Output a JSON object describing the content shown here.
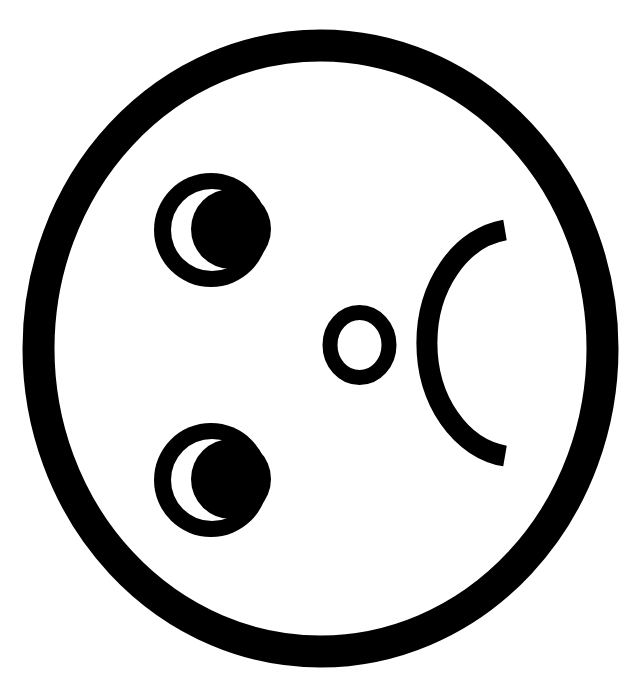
{
  "figure": {
    "background": "#ffffff",
    "ink": "#000000"
  },
  "face": {
    "outline": {
      "cx": 320.5,
      "cy": 348.5,
      "rx": 282,
      "ry": 303,
      "stroke_width": 32
    },
    "eyes": [
      {
        "name": "upper-eye",
        "cx": 211,
        "cy": 230,
        "r": 57,
        "crescent_outer": {
          "cx": 212,
          "cy": 230,
          "r": 41
        },
        "crescent_cut": {
          "cx": 231,
          "cy": 229,
          "r": 40
        }
      },
      {
        "name": "lower-eye",
        "cx": 211,
        "cy": 480,
        "r": 57,
        "crescent_outer": {
          "cx": 212,
          "cy": 480,
          "r": 41
        },
        "crescent_cut": {
          "cx": 231,
          "cy": 479,
          "r": 40
        }
      }
    ],
    "nose": {
      "cx": 359.5,
      "cy": 345,
      "rx": 29.5,
      "ry": 32.5,
      "stroke_width": 15
    },
    "mouth": {
      "start": [
        505,
        230
      ],
      "end": [
        505,
        456
      ],
      "rx": 90,
      "ry": 114,
      "stroke_width": 21
    }
  }
}
